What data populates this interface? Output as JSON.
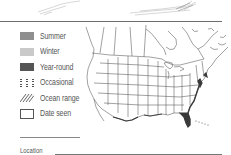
{
  "page": {
    "top_illustration": "bird-sketch-partial"
  },
  "legend": {
    "items": [
      {
        "label": "Summer",
        "color": "#8f8f8f",
        "pattern": "solid"
      },
      {
        "label": "Winter",
        "color": "#c9c9c9",
        "pattern": "solid"
      },
      {
        "label": "Year-round",
        "color": "#555555",
        "pattern": "solid"
      },
      {
        "label": "Occasional",
        "color": "#555555",
        "pattern": "dotted-columns"
      },
      {
        "label": "Ocean range",
        "color": "#555555",
        "pattern": "diagonal-hatch"
      },
      {
        "label": "Date seen",
        "color": "#555555",
        "pattern": "empty-box"
      }
    ]
  },
  "fields": {
    "location_label": "Location"
  },
  "map": {
    "region": "North America",
    "highlight_color": "#3a3a3a",
    "highlighted_range": "Atlantic and Gulf coasts (year-round)"
  }
}
